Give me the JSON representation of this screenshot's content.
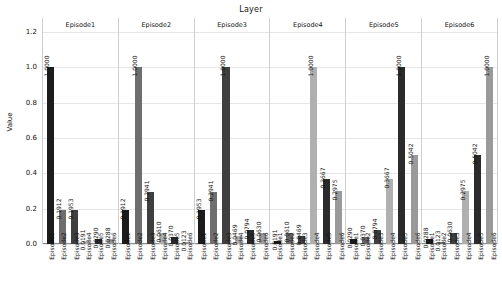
{
  "chart_data": {
    "type": "bar",
    "title": "Layer",
    "xlabel": "",
    "ylabel": "Value",
    "ylim": [
      0.0,
      1.2
    ],
    "yticks": [
      "0.0",
      "0.2",
      "0.4",
      "0.6",
      "0.8",
      "1.0",
      "1.2"
    ],
    "ytick_values": [
      0.0,
      0.2,
      0.4,
      0.6,
      0.8,
      1.0,
      1.2
    ],
    "grid": true,
    "legend": "none",
    "categories": [
      "Episode1",
      "Episode2",
      "Episode3",
      "Episode4",
      "Episode5",
      "Episode6"
    ],
    "bar_colors": [
      "#1c1c1c",
      "#6e6e6e",
      "#3f3f3f",
      "#b0b0b0",
      "#2b2b2b",
      "#9a9a9a"
    ],
    "panels": [
      {
        "label": "Episode1",
        "categories": [
          "Episode1",
          "Episode2",
          "Episode3",
          "Episode4",
          "Episode5",
          "Episode6"
        ],
        "values": [
          1.0,
          0.1912,
          0.1953,
          0.0191,
          0.029,
          0.0288
        ],
        "value_labels": [
          "1.0000",
          "0.1912",
          "0.1953",
          "0.0191",
          "0.0290",
          "0.0288"
        ]
      },
      {
        "label": "Episode2",
        "categories": [
          "Episode1",
          "Episode2",
          "Episode3",
          "Episode4",
          "Episode5",
          "Episode6"
        ],
        "values": [
          0.1912,
          1.0,
          0.2941,
          0.061,
          0.037,
          0.0123
        ],
        "value_labels": [
          "0.1912",
          "1.0000",
          "0.2941",
          "0.0610",
          "0.0370",
          "0.0123"
        ]
      },
      {
        "label": "Episode3",
        "categories": [
          "Episode1",
          "Episode2",
          "Episode3",
          "Episode4",
          "Episode5",
          "Episode6"
        ],
        "values": [
          0.1953,
          0.2941,
          1.0,
          0.0469,
          0.0794,
          0.063
        ],
        "value_labels": [
          "0.1953",
          "0.2941",
          "1.0000",
          "0.0469",
          "0.0794",
          "0.0630"
        ]
      },
      {
        "label": "Episode4",
        "categories": [
          "Episode1",
          "Episode2",
          "Episode3",
          "Episode4",
          "Episode5",
          "Episode6"
        ],
        "values": [
          0.0191,
          0.061,
          0.0469,
          1.0,
          0.3667,
          0.2975
        ],
        "value_labels": [
          "0.0191",
          "0.0610",
          "0.0469",
          "1.0000",
          "0.3667",
          "0.2975"
        ]
      },
      {
        "label": "Episode5",
        "categories": [
          "Episode1",
          "Episode2",
          "Episode3",
          "Episode4",
          "Episode5",
          "Episode6"
        ],
        "values": [
          0.029,
          0.037,
          0.0794,
          0.3667,
          1.0,
          0.5042
        ],
        "value_labels": [
          "0.0290",
          "0.0370",
          "0.0794",
          "0.3667",
          "1.0000",
          "0.5042"
        ]
      },
      {
        "label": "Episode6",
        "categories": [
          "Episode1",
          "Episode2",
          "Episode3",
          "Episode4",
          "Episode5",
          "Episode6"
        ],
        "values": [
          0.0288,
          0.0123,
          0.063,
          0.2975,
          0.5042,
          1.0
        ],
        "value_labels": [
          "0.0288",
          "0.0123",
          "0.0630",
          "0.2975",
          "0.5042",
          "1.0000"
        ]
      }
    ]
  }
}
